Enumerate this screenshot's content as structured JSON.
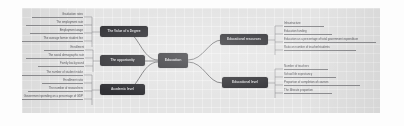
{
  "document": {
    "type": "mind-map",
    "title": "Mind map diagram",
    "canvas_background": "#e4e4e4",
    "node_color": "#2f2f33",
    "node_text_color": "#d9d9dc",
    "connector_color": "#4a4a4e",
    "leaf_text_color": "#5c5c60"
  },
  "center": {
    "label": "Education"
  },
  "branches": [
    {
      "id": "value-of-a-degree",
      "label": "The Value of a Degree",
      "side": "left",
      "items": [
        {
          "label": "Graduation rates"
        },
        {
          "label": "The employment rate"
        },
        {
          "label": "Employment wage"
        },
        {
          "label": "The average former student fee"
        }
      ]
    },
    {
      "id": "the-opportunity",
      "label": "The opportunity",
      "side": "left",
      "items": [
        {
          "label": "Enrollment"
        },
        {
          "label": "The social demographic rate"
        },
        {
          "label": "Family background"
        }
      ]
    },
    {
      "id": "academic-level",
      "label": "Academic level",
      "side": "left",
      "items": [
        {
          "label": "The number of student intake"
        },
        {
          "label": "Enrollment ratio"
        },
        {
          "label": "The number of researchers"
        },
        {
          "label": "Government spending on a percentage of GDP"
        }
      ]
    },
    {
      "id": "educational-resources",
      "label": "Educational resources",
      "side": "right",
      "items": [
        {
          "label": "Infrastructure"
        },
        {
          "label": "Education funding"
        },
        {
          "label": "Education as a percentage of total government expenditure"
        },
        {
          "label": "Ratio on number of teacher/students"
        }
      ]
    },
    {
      "id": "educational-level",
      "label": "Educational level",
      "side": "right",
      "items": [
        {
          "label": "Number of teachers"
        },
        {
          "label": "School life expectancy"
        },
        {
          "label": "Proportion of completion of courses"
        },
        {
          "label": "The illiterate proportion"
        }
      ]
    }
  ]
}
